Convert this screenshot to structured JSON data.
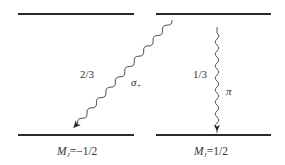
{
  "diagram": {
    "type": "energy-level transition diagram",
    "levels": {
      "upper_left": {
        "y": 14
      },
      "upper_right": {
        "y": 14
      },
      "lower_left": {
        "y": 135,
        "label": "M_J=−1/2"
      },
      "lower_right": {
        "y": 135,
        "label": "M_J=1/2"
      }
    },
    "transitions": [
      {
        "name": "sigma-plus",
        "symbol": "σ",
        "subscript": "+",
        "branching": "2/3"
      },
      {
        "name": "pi",
        "symbol": "π",
        "branching": "1/3"
      }
    ],
    "labels": {
      "left_M": "M",
      "left_sub": "J",
      "left_val": "=−1/2",
      "right_M": "M",
      "right_sub": "J",
      "right_val": "=1/2",
      "sigma_ratio": "2/3",
      "sigma_symbol": "σ",
      "sigma_sub": "+",
      "pi_ratio": "1/3",
      "pi_symbol": "π"
    },
    "line_color": "#2a2a2a"
  }
}
